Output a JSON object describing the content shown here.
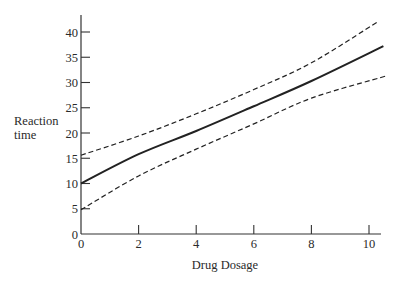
{
  "chart_data": {
    "type": "line",
    "title": "",
    "xlabel": "Drug Dosage",
    "ylabel": [
      "Reaction",
      "time"
    ],
    "xlim": [
      0,
      10.5
    ],
    "ylim": [
      0,
      42
    ],
    "xticks": [
      0,
      2,
      4,
      6,
      8,
      10
    ],
    "yticks": [
      0,
      5,
      10,
      15,
      20,
      25,
      30,
      35,
      40
    ],
    "grid": false,
    "legend": null,
    "series": [
      {
        "name": "Regression line",
        "style": "solid",
        "x": [
          0,
          2,
          4,
          6,
          8,
          10.5
        ],
        "y": [
          10,
          15.8,
          20.4,
          25.3,
          30.3,
          37.2
        ]
      },
      {
        "name": "Upper confidence band",
        "style": "dashed",
        "x": [
          0,
          2,
          4,
          6,
          8,
          10.3
        ],
        "y": [
          15.6,
          19.4,
          23.8,
          28.6,
          33.9,
          42
        ]
      },
      {
        "name": "Lower confidence band",
        "style": "dashed",
        "x": [
          0,
          2,
          4,
          6,
          8,
          10.6
        ],
        "y": [
          4.8,
          11.5,
          16.8,
          21.8,
          26.9,
          31.3
        ]
      }
    ]
  }
}
